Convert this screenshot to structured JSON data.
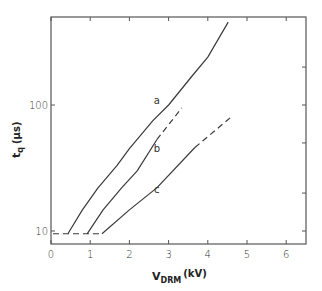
{
  "chart_data": {
    "type": "line",
    "title": "",
    "xlabel": "V_DRM (kV)",
    "xlabel_main": "V",
    "xlabel_sub": "DRM",
    "xlabel_unit": "(kV)",
    "ylabel": "t_q (μs)",
    "ylabel_main": "t",
    "ylabel_sub": "q",
    "ylabel_unit": "(μs)",
    "xscale": "linear",
    "yscale": "log",
    "xlim": [
      0,
      6.5
    ],
    "ylim": [
      7.9,
      500
    ],
    "grid": false,
    "legend": "inline labels",
    "x_ticks": [
      0,
      1,
      2,
      3,
      4,
      5,
      6
    ],
    "x_tick_labels": [
      "0",
      "1",
      "2",
      "3",
      "4",
      "5",
      "6"
    ],
    "y_ticks_labeled": [
      10,
      100
    ],
    "y_tick_labels": [
      "10",
      "100"
    ],
    "y_ticks_minor": [
      20,
      50,
      200
    ],
    "baseline": {
      "style": "dashed",
      "x": [
        0,
        1.3
      ],
      "y": [
        9.5,
        9.5
      ]
    },
    "series": [
      {
        "name": "a",
        "solid": {
          "x": [
            0.43,
            0.8,
            1.2,
            1.68,
            2.0,
            2.6,
            3.0,
            3.6,
            4.0,
            4.52
          ],
          "y": [
            9.5,
            14.7,
            22,
            33,
            45,
            75,
            100,
            170,
            240,
            455
          ]
        },
        "dashed": null,
        "label_pos": {
          "x": 2.7,
          "y": 108
        }
      },
      {
        "name": "b",
        "solid": {
          "x": [
            0.92,
            1.33,
            1.8,
            2.2,
            2.7
          ],
          "y": [
            9.5,
            14.7,
            22,
            30,
            53
          ]
        },
        "dashed": {
          "x": [
            2.7,
            3.34
          ],
          "y": [
            53,
            95
          ]
        },
        "label_pos": {
          "x": 2.7,
          "y": 45
        }
      },
      {
        "name": "c",
        "solid": {
          "x": [
            1.3,
            2.0,
            2.7,
            3.67
          ],
          "y": [
            9.5,
            14.7,
            22,
            46
          ]
        },
        "dashed": {
          "x": [
            3.67,
            4.57
          ],
          "y": [
            46,
            79
          ]
        },
        "label_pos": {
          "x": 2.7,
          "y": 21
        }
      }
    ]
  }
}
